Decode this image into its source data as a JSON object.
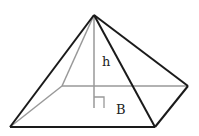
{
  "diagram": {
    "type": "square pyramid",
    "labels": {
      "height": "h",
      "base": "B"
    },
    "points": {
      "apex": [
        94,
        15
      ],
      "back_left": [
        62,
        86
      ],
      "back_right": [
        188,
        86
      ],
      "front_left": [
        10,
        127
      ],
      "front_right": [
        155,
        127
      ],
      "height_foot": [
        94,
        108
      ]
    },
    "colors": {
      "visible_edge": "#1a1a1a",
      "hidden_edge": "#999999"
    }
  }
}
